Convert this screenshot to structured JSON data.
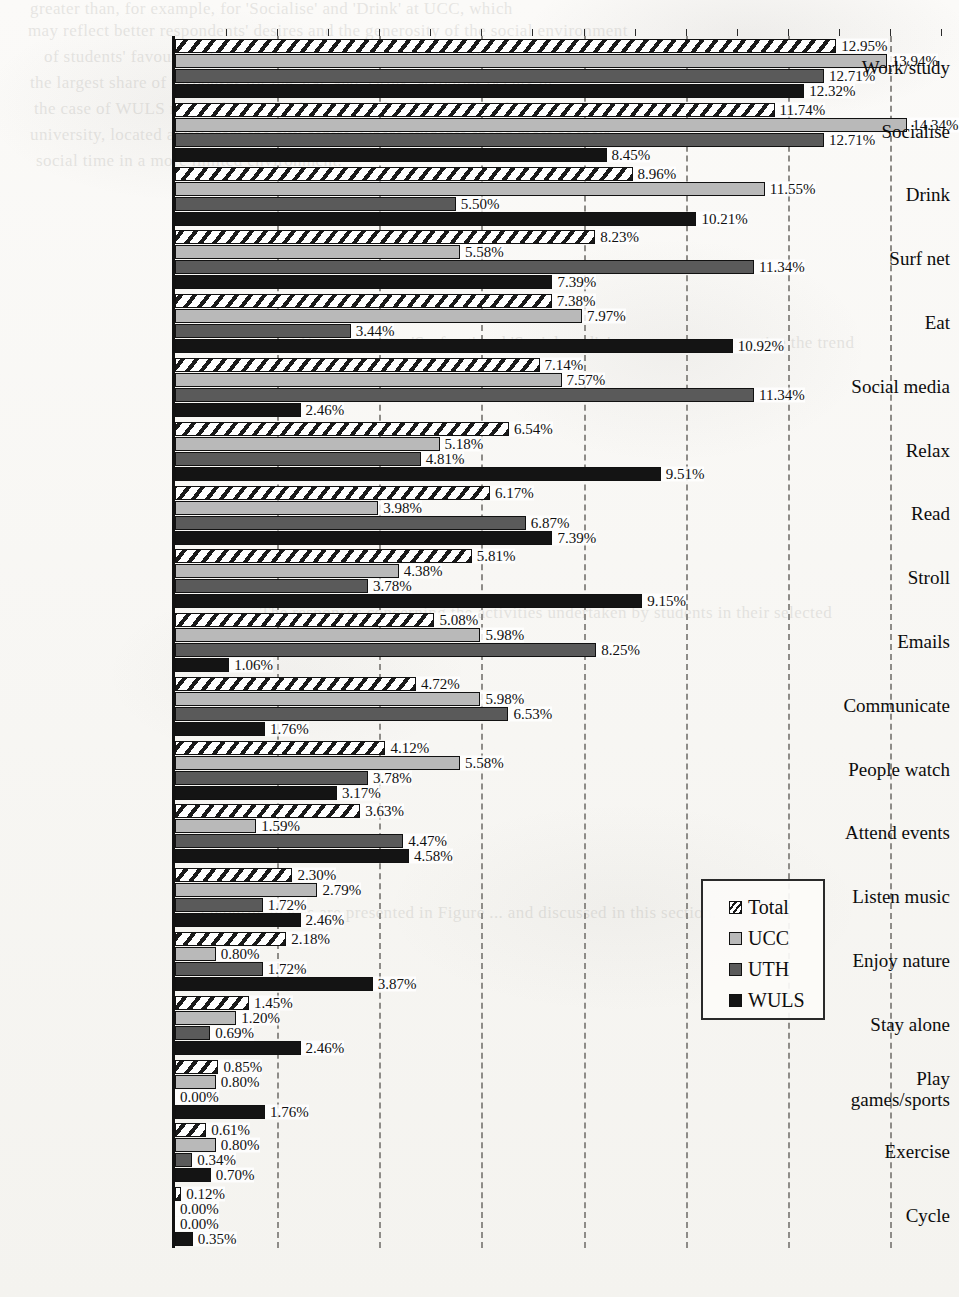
{
  "chart_data": {
    "type": "bar",
    "orientation": "horizontal",
    "title": "",
    "xlabel": "",
    "ylabel": "",
    "xlim": [
      0,
      15
    ],
    "grid": true,
    "grid_interval": 2,
    "legend_position": "center-right",
    "value_format": "percent",
    "categories": [
      "Work/study",
      "Socialise",
      "Drink",
      "Surf net",
      "Eat",
      "Social media",
      "Relax",
      "Read",
      "Stroll",
      "Emails",
      "Communicate",
      "People watch",
      "Attend events",
      "Listen music",
      "Enjoy nature",
      "Stay alone",
      "Play\ngames/sports",
      "Exercise",
      "Cycle"
    ],
    "series": [
      {
        "name": "Total",
        "values": [
          12.95,
          11.74,
          8.96,
          8.23,
          7.38,
          7.14,
          6.54,
          6.17,
          5.81,
          5.08,
          4.72,
          4.12,
          3.63,
          2.3,
          2.18,
          1.45,
          0.85,
          0.61,
          0.12
        ],
        "labels": [
          "12.95%",
          "11.74%",
          "8.96%",
          "8.23%",
          "7.38%",
          "7.14%",
          "6.54%",
          "6.17%",
          "5.81%",
          "5.08%",
          "4.72%",
          "4.12%",
          "3.63%",
          "2.30%",
          "2.18%",
          "1.45%",
          "0.85%",
          "0.61%",
          "0.12%"
        ]
      },
      {
        "name": "UCC",
        "values": [
          13.94,
          14.34,
          11.55,
          5.58,
          7.97,
          7.57,
          5.18,
          3.98,
          4.38,
          5.98,
          5.98,
          5.58,
          1.59,
          2.79,
          0.8,
          1.2,
          0.8,
          0.8,
          0.0
        ],
        "labels": [
          "13.94%",
          "14.34%",
          "11.55%",
          "5.58%",
          "7.97%",
          "7.57%",
          "5.18%",
          "3.98%",
          "4.38%",
          "5.98%",
          "5.98%",
          "5.58%",
          "1.59%",
          "2.79%",
          "0.80%",
          "1.20%",
          "0.80%",
          "0.80%",
          "0.00%"
        ]
      },
      {
        "name": "UTH",
        "values": [
          12.71,
          12.71,
          5.5,
          11.34,
          3.44,
          11.34,
          4.81,
          6.87,
          3.78,
          8.25,
          6.53,
          3.78,
          4.47,
          1.72,
          1.72,
          0.69,
          0.0,
          0.34,
          0.0
        ],
        "labels": [
          "12.71%",
          "12.71%",
          "5.50%",
          "11.34%",
          "3.44%",
          "11.34%",
          "4.81%",
          "6.87%",
          "3.78%",
          "8.25%",
          "6.53%",
          "3.78%",
          "4.47%",
          "1.72%",
          "1.72%",
          "0.69%",
          "0.00%",
          "0.34%",
          "0.00%"
        ]
      },
      {
        "name": "WULS",
        "values": [
          12.32,
          8.45,
          10.21,
          7.39,
          10.92,
          2.46,
          9.51,
          7.39,
          9.15,
          1.06,
          1.76,
          3.17,
          4.58,
          2.46,
          3.87,
          2.46,
          1.76,
          0.7,
          0.35
        ],
        "labels": [
          "12.32%",
          "8.45%",
          "10.21%",
          "7.39%",
          "10.92%",
          "2.46%",
          "9.51%",
          "7.39%",
          "9.15%",
          "1.06%",
          "1.76%",
          "3.17%",
          "4.58%",
          "2.46%",
          "3.87%",
          "2.46%",
          "1.76%",
          "0.70%",
          "0.35%"
        ]
      }
    ],
    "gridline_values": [
      2,
      4,
      6,
      8,
      10,
      12,
      14
    ],
    "colors": {
      "total": "#ffffff",
      "ucc": "#b9b9b9",
      "uth": "#5a5a5a",
      "wuls": "#141414",
      "axis": "#111111",
      "grid": "#8e8c88"
    }
  },
  "legend": {
    "items": [
      {
        "label": "Total"
      },
      {
        "label": "UCC"
      },
      {
        "label": "UTH"
      },
      {
        "label": "WULS"
      }
    ]
  },
  "background_ghost_text": [
    "greater than, for example, for 'Socialise' and 'Drink' at UCC, which",
    "may reflect better respondents' desires and the generosity of the social environment",
    "of students' favourite places in the various cities. Additionally, one can observe that",
    "the largest share of responses for the 'Eat' and 'Drink' activities occurs in",
    "the case of WULS respondents, which may be related to the fact that it is a campus",
    "university, located away from the city centre, where students spend most of their",
    "social time in a more limited environment.",
    "Comparing the 'Surf net' and 'Social media' answers, one can notice the trend",
    "The responses concerning the activities undertaken by students in their selected",
    "favourite places are presented in Figure ... and discussed in this section."
  ]
}
